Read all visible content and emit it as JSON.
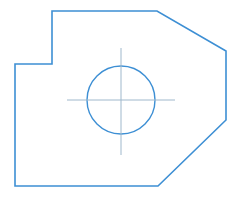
{
  "drawing": {
    "title": "Mechanical part outline with through hole",
    "view_type": "2D orthographic front view",
    "canvas": {
      "width": 242,
      "height": 218,
      "background_color": "#ffffff"
    },
    "style": {
      "outline_color": "#3d8fd4",
      "outline_width": 1.6,
      "hole_color": "#3d8fd4",
      "hole_width": 1.4,
      "centerline_color": "#9fb8cc",
      "centerline_width": 1.0
    },
    "outline": {
      "name": "part-profile",
      "shape": "closed polygon with step notch at upper-left and two chamfers on right side",
      "points_attr": "52,11 157,11 226,51 226,120 158,186 15,186 15,64 52,64",
      "vertices": [
        {
          "label": "notch-top-left",
          "x": 52,
          "y": 11
        },
        {
          "label": "top-right-before-chamfer",
          "x": 157,
          "y": 11
        },
        {
          "label": "upper-chamfer-end",
          "x": 226,
          "y": 51
        },
        {
          "label": "right-edge-bottom",
          "x": 226,
          "y": 120
        },
        {
          "label": "lower-chamfer-end",
          "x": 158,
          "y": 186
        },
        {
          "label": "bottom-left",
          "x": 15,
          "y": 186
        },
        {
          "label": "left-edge-top",
          "x": 15,
          "y": 64
        },
        {
          "label": "notch-bottom-right",
          "x": 52,
          "y": 64
        }
      ]
    },
    "hole": {
      "name": "through-hole",
      "center_x": 121,
      "center_y": 100,
      "radius": 34
    },
    "centerlines": {
      "horizontal": {
        "x1": 67,
        "y1": 100,
        "x2": 175,
        "y2": 100
      },
      "vertical": {
        "x1": 121,
        "y1": 48,
        "x2": 121,
        "y2": 155
      }
    }
  }
}
